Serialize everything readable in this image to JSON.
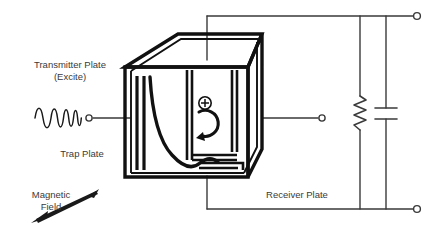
{
  "figure": {
    "background_color": "#ffffff",
    "line_color": "#1a1a1a",
    "text_color": "#3a3a3a"
  },
  "labels": {
    "transmitter": "Transmitter Plate\n(Excite)",
    "transmitter_line1": "Transmitter Plate",
    "transmitter_line2": "(Excite)",
    "trap": "Trap Plate",
    "magnetic_line1": "Magnetic",
    "magnetic_line2": "Field",
    "receiver": "Receiver Plate"
  },
  "icons": {
    "excitation_waveform": "chirp-waveform-icon",
    "ion_charge": "plus-charge-icon",
    "ion_orbit": "circular-orbit-arrow-icon",
    "magnetic_field_arrow": "double-headed-arrow-icon",
    "resistor": "resistor-zigzag-icon",
    "capacitor": "capacitor-plates-icon",
    "terminal": "terminal-node-icon"
  },
  "symbols": {
    "ion_charge_glyph": "+"
  },
  "circuit": {
    "terminals": [
      {
        "name": "excite-input-terminal",
        "x": 89,
        "y": 118
      },
      {
        "name": "receiver-output-terminal",
        "x": 322,
        "y": 118
      },
      {
        "name": "top-right-terminal",
        "x": 417,
        "y": 16
      },
      {
        "name": "bottom-right-terminal",
        "x": 417,
        "y": 209
      }
    ],
    "components": [
      {
        "name": "resistor",
        "type": "resistor",
        "x": 360,
        "y_top": 93,
        "y_bottom": 130
      },
      {
        "name": "capacitor",
        "type": "capacitor",
        "x": 386,
        "y_top": 108,
        "y_bottom": 118
      }
    ]
  },
  "cell": {
    "name": "icr-cell-box",
    "description": "Cubic ion cyclotron resonance trapping cell drawn in isometric projection"
  }
}
